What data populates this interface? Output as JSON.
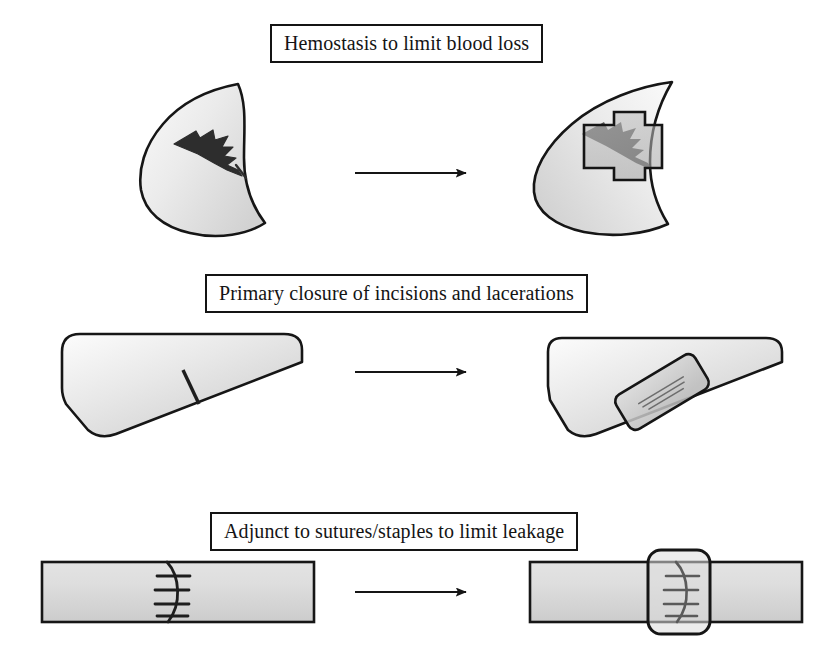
{
  "figure": {
    "background_color": "#ffffff",
    "ink_color": "#141414",
    "tissue_fill_light": "#f2f2f2",
    "tissue_fill_mid": "#cfcfcf",
    "patch_fill": "#b3b3b3",
    "wound_color": "#2b2b2b"
  },
  "rows": [
    {
      "id": "hemostasis",
      "caption": "Hemostasis to limit blood loss",
      "caption_box": {
        "x": 270,
        "y": 24,
        "width": 284,
        "height": 36
      },
      "before": {
        "organ_name": "crescent-organ-lacerated",
        "wound_name": "laceration-jagged-tear",
        "wound_type": "jagged laceration"
      },
      "after": {
        "organ_name": "crescent-organ-treated",
        "patch_name": "cross-shaped-sealant-patch",
        "patch_shape": "cross"
      },
      "arrow": {
        "x1": 355,
        "y1": 173,
        "x2": 468,
        "y2": 173
      }
    },
    {
      "id": "primary-closure",
      "caption": "Primary closure of incisions and lacerations",
      "caption_box": {
        "x": 205,
        "y": 274,
        "width": 412,
        "height": 36
      },
      "before": {
        "organ_name": "wedge-organ-incised",
        "wound_name": "incision-line",
        "wound_type": "linear incision"
      },
      "after": {
        "organ_name": "wedge-organ-treated",
        "patch_name": "angled-rectangular-sealant-patch",
        "patch_shape": "rounded-rectangle"
      },
      "arrow": {
        "x1": 355,
        "y1": 372,
        "x2": 468,
        "y2": 372
      }
    },
    {
      "id": "adjunct-sutures",
      "caption": "Adjunct to sutures/staples to limit leakage",
      "caption_box": {
        "x": 210,
        "y": 512,
        "width": 402,
        "height": 36
      },
      "before": {
        "organ_name": "tubular-organ-sutured",
        "wound_name": "suture-line-with-staples",
        "wound_type": "sutured anastomosis",
        "stitch_count": 4
      },
      "after": {
        "organ_name": "tubular-organ-treated",
        "patch_name": "wrap-sealant-patch",
        "patch_shape": "rounded-rectangle"
      },
      "arrow": {
        "x1": 355,
        "y1": 592,
        "x2": 468,
        "y2": 592
      }
    }
  ]
}
